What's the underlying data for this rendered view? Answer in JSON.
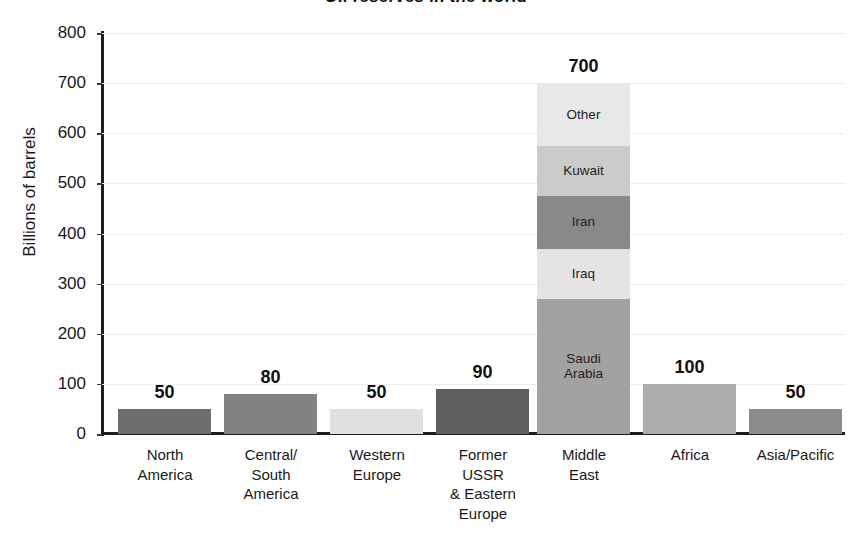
{
  "chart_data": {
    "type": "bar",
    "title": "Oil reserves in the world",
    "xlabel": "",
    "ylabel": "Billions of barrels",
    "ylim": [
      0,
      800
    ],
    "ytick_step": 100,
    "yticks": [
      "800",
      "700",
      "600",
      "500",
      "400",
      "300",
      "200",
      "100",
      "0"
    ],
    "grid": true,
    "legend": "none",
    "stacked": true,
    "categories": [
      "North America",
      "Central/ South America",
      "Western Europe",
      "Former USSR & Eastern Europe",
      "Middle East",
      "Africa",
      "Asia/Pacific"
    ],
    "values": [
      50,
      80,
      50,
      90,
      700,
      100,
      50
    ],
    "value_labels": [
      "50",
      "80",
      "50",
      "90",
      "700",
      "100",
      "50"
    ],
    "middle_east_breakdown": {
      "note": "Middle East bar is internally segmented bottom-to-top",
      "segments": [
        {
          "name": "Saudi Arabia",
          "value": 270
        },
        {
          "name": "Iraq",
          "value": 100
        },
        {
          "name": "Iran",
          "value": 105
        },
        {
          "name": "Kuwait",
          "value": 100
        },
        {
          "name": "Other",
          "value": 125
        }
      ]
    },
    "colors": {
      "north_america": "#6e6e6e",
      "central_south_america": "#828282",
      "western_europe": "#e0e0e0",
      "former_ussr": "#5f5f5f",
      "africa": "#adadad",
      "asia_pacific": "#8c8c8c",
      "saudi_arabia": "#a2a2a2",
      "iraq": "#e4e4e4",
      "iran": "#898989",
      "kuwait": "#cbcbcb",
      "other": "#e8e8e8",
      "axis": "#1d1d1d",
      "gridline": "#ededed"
    }
  },
  "bars": [
    {
      "category_lines": [
        "North",
        "America"
      ],
      "value": 50,
      "value_label": "50",
      "x": 118,
      "width": 93,
      "label_x": 110,
      "label_width": 110,
      "segments": [
        {
          "name": "",
          "value": 50,
          "color": "#6e6e6e",
          "label": ""
        }
      ]
    },
    {
      "category_lines": [
        "Central/",
        "South",
        "America"
      ],
      "value": 80,
      "value_label": "80",
      "x": 224,
      "width": 93,
      "label_x": 216,
      "label_width": 110,
      "segments": [
        {
          "name": "",
          "value": 80,
          "color": "#828282",
          "label": ""
        }
      ]
    },
    {
      "category_lines": [
        "Western",
        "Europe"
      ],
      "value": 50,
      "value_label": "50",
      "x": 330,
      "width": 93,
      "label_x": 322,
      "label_width": 110,
      "segments": [
        {
          "name": "",
          "value": 50,
          "color": "#e0e0e0",
          "label": ""
        }
      ]
    },
    {
      "category_lines": [
        "Former",
        "USSR",
        "& Eastern",
        "Europe"
      ],
      "value": 90,
      "value_label": "90",
      "x": 436,
      "width": 93,
      "label_x": 428,
      "label_width": 110,
      "segments": [
        {
          "name": "",
          "value": 90,
          "color": "#5f5f5f",
          "label": ""
        }
      ]
    },
    {
      "category_lines": [
        "Middle",
        "East"
      ],
      "value": 700,
      "value_label": "700",
      "x": 537,
      "width": 93,
      "label_x": 529,
      "label_width": 110,
      "segments": [
        {
          "name": "Saudi Arabia",
          "value": 270,
          "color": "#a2a2a2",
          "label": "Saudi\nArabia"
        },
        {
          "name": "Iraq",
          "value": 100,
          "color": "#e4e4e4",
          "label": "Iraq"
        },
        {
          "name": "Iran",
          "value": 105,
          "color": "#898989",
          "label": "Iran"
        },
        {
          "name": "Kuwait",
          "value": 100,
          "color": "#cbcbcb",
          "label": "Kuwait"
        },
        {
          "name": "Other",
          "value": 125,
          "color": "#e8e8e8",
          "label": "Other"
        }
      ]
    },
    {
      "category_lines": [
        "Africa"
      ],
      "value": 100,
      "value_label": "100",
      "x": 643,
      "width": 93,
      "label_x": 635,
      "label_width": 110,
      "segments": [
        {
          "name": "",
          "value": 100,
          "color": "#adadad",
          "label": ""
        }
      ]
    },
    {
      "category_lines": [
        "Asia/Pacific"
      ],
      "value": 50,
      "value_label": "50",
      "x": 749,
      "width": 93,
      "label_x": 733,
      "label_width": 125,
      "segments": [
        {
          "name": "",
          "value": 50,
          "color": "#8c8c8c",
          "label": ""
        }
      ]
    }
  ]
}
